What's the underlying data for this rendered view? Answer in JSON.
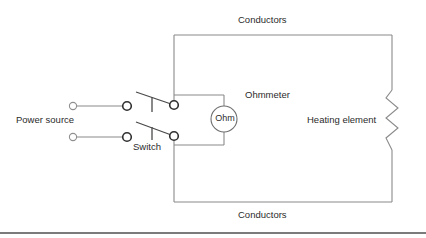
{
  "diagram": {
    "labels": {
      "conductors_top": "Conductors",
      "conductors_bottom": "Conductors",
      "power_source": "Power source",
      "switch": "Switch",
      "ohmmeter": "Ohmmeter",
      "ohmmeter_symbol_text": "Ohm",
      "heating_element": "Heating element"
    },
    "colors": {
      "background": "#ffffff",
      "wire": "#8a8a8a",
      "wire_dark": "#4a4a4a",
      "text": "#2b2b2b",
      "terminal_fill": "#ffffff",
      "terminal_stroke": "#2f2f2f",
      "baseline": "#4f4f4f"
    },
    "components": [
      {
        "name": "power-source",
        "type": "source",
        "terminals": 2
      },
      {
        "name": "switch",
        "type": "double-pole-switch",
        "state": "open"
      },
      {
        "name": "ohmmeter",
        "type": "meter",
        "reading_label": "Ohm"
      },
      {
        "name": "heating-element",
        "type": "resistor",
        "symbol": "zigzag"
      },
      {
        "name": "conductors",
        "type": "wire",
        "count": 2
      }
    ]
  }
}
